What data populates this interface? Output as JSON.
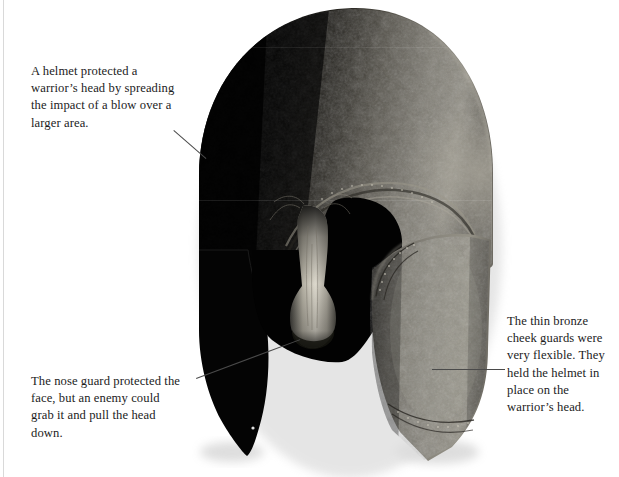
{
  "figure": {
    "background_color": "#ffffff",
    "text_color": "#1c1c1c",
    "leader_line_color": "#4a4a4a"
  },
  "callouts": [
    {
      "id": "helmet",
      "text": "A helmet protected a warrior’s head by spreading the impact of a blow over a larger area.",
      "target": "helmet-dome"
    },
    {
      "id": "nose",
      "text": "The nose guard protected the face, but an enemy could grab it and pull the head down.",
      "target": "nose-guard"
    },
    {
      "id": "cheek",
      "text": "The thin bronze cheek guards were very flexible. They held the helmet in place on the warrior’s head.",
      "target": "right-cheek-guard"
    }
  ],
  "artwork": {
    "parts": [
      "helmet-dome",
      "brow-ridge",
      "eye-opening",
      "nose-guard",
      "left-cheek-guard",
      "right-cheek-guard"
    ],
    "colors": {
      "shadow_side": "#050505",
      "lit_bronze": "#8a8880",
      "mid_bronze": "#55534e",
      "nose_highlight": "#d6d2c6",
      "drop_shadow": "#c9c9c9"
    }
  }
}
